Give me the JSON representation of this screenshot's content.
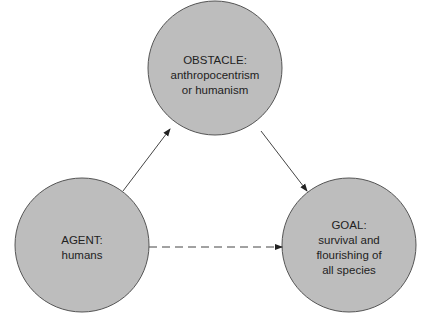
{
  "colors": {
    "node_fill": "#bdbdbd",
    "node_stroke": "#555555",
    "edge": "#444444",
    "text": "#222222"
  },
  "nodes": [
    {
      "id": "obstacle",
      "title": "OBSTACLE:",
      "lines": [
        "anthropocentrism",
        "or humanism"
      ]
    },
    {
      "id": "agent",
      "title": "AGENT:",
      "lines": [
        "humans"
      ]
    },
    {
      "id": "goal",
      "title": "GOAL:",
      "lines": [
        "survival and",
        "flourishing of",
        "all species"
      ]
    }
  ],
  "edges": [
    {
      "from": "agent",
      "to": "obstacle",
      "style": "solid"
    },
    {
      "from": "obstacle",
      "to": "goal",
      "style": "solid"
    },
    {
      "from": "agent",
      "to": "goal",
      "style": "dashed"
    }
  ]
}
